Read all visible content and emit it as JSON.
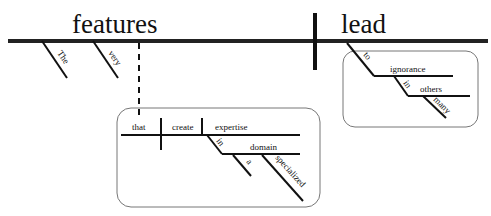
{
  "diagram": {
    "type": "Reed-Kellogg sentence diagram",
    "subject": "features",
    "verb": "lead",
    "subject_modifiers": [
      "The",
      "very"
    ],
    "relative_clause": {
      "subject": "that",
      "verb": "create",
      "object": "expertise",
      "preposition": "in",
      "prep_object": "domain",
      "prep_object_modifiers": [
        "a",
        "specialized"
      ]
    },
    "verb_phrase": {
      "preposition": "to",
      "prep_object": "ignorance",
      "sub_preposition": "in",
      "sub_prep_object": "others",
      "sub_prep_object_modifier": "many"
    }
  }
}
